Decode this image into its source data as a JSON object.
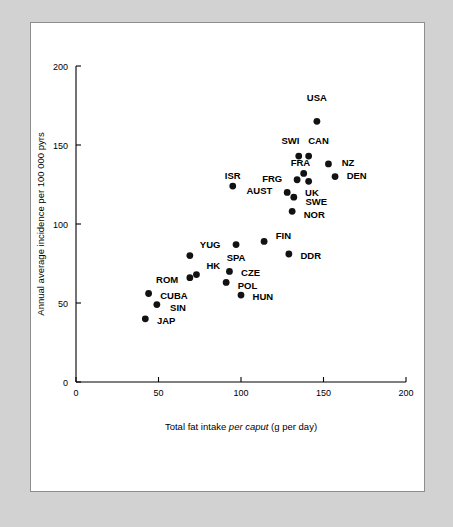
{
  "figure": {
    "background_color": "#d2d2d2",
    "panel_color": "#ffffff",
    "panel_border_color": "#8e8e8e",
    "point_color": "#121212"
  },
  "chart_data": {
    "type": "scatter",
    "title": "",
    "xlabel_plain_1": "Total fat intake ",
    "xlabel_italic": "per caput",
    "xlabel_plain_2": " (g per day)",
    "ylabel": "Annual average incidence per 100 000 pyrs",
    "xlim": [
      0,
      200
    ],
    "ylim": [
      0,
      200
    ],
    "xticks": [
      0,
      50,
      100,
      150,
      200
    ],
    "yticks": [
      0,
      50,
      100,
      150,
      200
    ],
    "xticklabels": [
      "0",
      "50",
      "100",
      "150",
      "200"
    ],
    "yticklabels": [
      "0",
      "50",
      "100",
      "150",
      "200"
    ],
    "grid": false,
    "legend": "none",
    "points": [
      {
        "label": "USA",
        "x": 146,
        "y": 165,
        "lx": 146,
        "ly": 180,
        "anchor": "middle"
      },
      {
        "label": "SWI",
        "x": 135,
        "y": 143,
        "lx": 130,
        "ly": 153,
        "anchor": "middle"
      },
      {
        "label": "CAN",
        "x": 141,
        "y": 143,
        "lx": 147,
        "ly": 153,
        "anchor": "middle"
      },
      {
        "label": "NZ",
        "x": 153,
        "y": 138,
        "lx": 158,
        "ly": 139,
        "anchor": "start"
      },
      {
        "label": "FRA",
        "x": 138,
        "y": 132,
        "lx": 136,
        "ly": 139,
        "anchor": "middle"
      },
      {
        "label": "FRG",
        "x": 134,
        "y": 128,
        "lx": 128,
        "ly": 129,
        "anchor": "end"
      },
      {
        "label": "DEN",
        "x": 157,
        "y": 130,
        "lx": 161,
        "ly": 131,
        "anchor": "start"
      },
      {
        "label": "UK",
        "x": 141,
        "y": 127,
        "lx": 143,
        "ly": 120,
        "anchor": "middle"
      },
      {
        "label": "ISR",
        "x": 95,
        "y": 124,
        "lx": 95,
        "ly": 131,
        "anchor": "middle"
      },
      {
        "label": "AUST",
        "x": 128,
        "y": 120,
        "lx": 122,
        "ly": 121,
        "anchor": "end"
      },
      {
        "label": "SWE",
        "x": 132,
        "y": 117,
        "lx": 136,
        "ly": 114,
        "anchor": "start"
      },
      {
        "label": "NOR",
        "x": 131,
        "y": 108,
        "lx": 135,
        "ly": 106,
        "anchor": "start"
      },
      {
        "label": "FIN",
        "x": 114,
        "y": 89,
        "lx": 118,
        "ly": 93,
        "anchor": "start"
      },
      {
        "label": "SPA",
        "x": 97,
        "y": 87,
        "lx": 97,
        "ly": 79,
        "anchor": "middle"
      },
      {
        "label": "DDR",
        "x": 129,
        "y": 81,
        "lx": 133,
        "ly": 80,
        "anchor": "start"
      },
      {
        "label": "YUG",
        "x": 69,
        "y": 80,
        "lx": 72,
        "ly": 87,
        "anchor": "start"
      },
      {
        "label": "CZE",
        "x": 93,
        "y": 70,
        "lx": 97,
        "ly": 69,
        "anchor": "start"
      },
      {
        "label": "HK",
        "x": 73,
        "y": 68,
        "lx": 76,
        "ly": 74,
        "anchor": "start"
      },
      {
        "label": "ROM",
        "x": 69,
        "y": 66,
        "lx": 65,
        "ly": 65,
        "anchor": "end"
      },
      {
        "label": "POL",
        "x": 91,
        "y": 63,
        "lx": 95,
        "ly": 61,
        "anchor": "start"
      },
      {
        "label": "CUBA",
        "x": 44,
        "y": 56,
        "lx": 48,
        "ly": 55,
        "anchor": "start"
      },
      {
        "label": "HUN",
        "x": 100,
        "y": 55,
        "lx": 104,
        "ly": 54,
        "anchor": "start"
      },
      {
        "label": "SIN",
        "x": 49,
        "y": 49,
        "lx": 54,
        "ly": 47,
        "anchor": "start"
      },
      {
        "label": "JAP",
        "x": 42,
        "y": 40,
        "lx": 46,
        "ly": 39,
        "anchor": "start"
      }
    ]
  }
}
